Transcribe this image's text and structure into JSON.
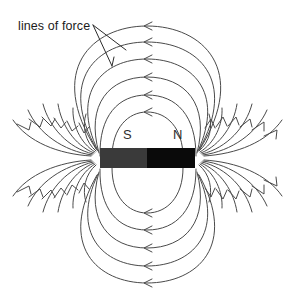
{
  "figure": {
    "background_color": "#ffffff",
    "width": 293,
    "height": 295
  },
  "annotations": {
    "lines_of_force_label": "lines of force",
    "leader_line_count": 2
  },
  "magnet": {
    "south_pole_label": "S",
    "north_pole_label": "N",
    "south_color": "#3a3a3a",
    "north_color": "#0a0a0a",
    "x": 100,
    "y": 148,
    "width": 95,
    "height": 20,
    "split_x": 147
  },
  "field": {
    "stroke_color": "#4a4a4a",
    "stroke_width": 1,
    "closed_loops_above": 4,
    "closed_loops_below": 4,
    "arrow_direction_top": "left",
    "arrow_direction_bottom": "left",
    "arrow_direction_left_side": "into-south-pole",
    "arrow_direction_right_side": "out-of-north-pole",
    "open_lines_per_quadrant": 6
  },
  "chart_data": {
    "type": "diagram",
    "center": [
      147.5,
      158
    ],
    "closed_loops": [
      {
        "id": 1,
        "rx": 40,
        "ry": 28,
        "arrow_top_y": 130,
        "arrow_bottom_y": 186
      },
      {
        "id": 2,
        "rx": 58,
        "ry": 46,
        "arrow_top_y": 112,
        "arrow_bottom_y": 204
      },
      {
        "id": 3,
        "rx": 76,
        "ry": 64,
        "arrow_top_y": 94,
        "arrow_bottom_y": 222
      },
      {
        "id": 4,
        "rx": 94,
        "ry": 82,
        "arrow_top_y": 76,
        "arrow_bottom_y": 240
      },
      {
        "id": 5,
        "rx": 112,
        "ry": 100,
        "arrow_top_y": 58,
        "arrow_bottom_y": 258
      },
      {
        "id": 6,
        "rx": 128,
        "ry": 118,
        "arrow_top_y": 40,
        "arrow_bottom_y": 276
      }
    ],
    "pole_positions": {
      "south": [
        127,
        135
      ],
      "north": [
        177,
        135
      ]
    }
  }
}
